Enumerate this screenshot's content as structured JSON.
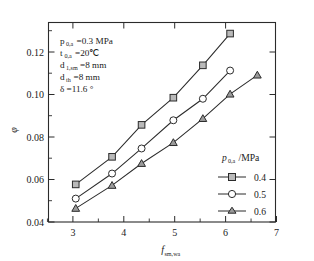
{
  "chart_data": {
    "type": "line",
    "title": "",
    "xlabel": "f_sm,wa",
    "ylabel": "φ",
    "xlim": [
      2.6,
      7.6
    ],
    "ylim": [
      0.04,
      0.1355
    ],
    "grid": false,
    "legend_position": "inside-bottom-right",
    "legend_title": "p0,a/MPa",
    "xticks": [
      "3",
      "4",
      "5",
      "6",
      "7"
    ],
    "xtick_values": [
      3,
      4,
      5,
      6,
      7
    ],
    "yticks": [
      "0.04",
      "0.06",
      "0.08",
      "0.10",
      "0.12"
    ],
    "ytick_values": [
      0.04,
      0.06,
      0.08,
      0.1,
      0.12
    ],
    "series": [
      {
        "name": "0.4",
        "marker": "square",
        "x": [
          3.2,
          4.0,
          4.65,
          5.35,
          6.0,
          6.6
        ],
        "values": [
          0.058,
          0.0712,
          0.0865,
          0.0995,
          0.115,
          0.1302
        ]
      },
      {
        "name": "0.5",
        "marker": "circle",
        "x": [
          3.2,
          4.0,
          4.65,
          5.35,
          6.0,
          6.6
        ],
        "values": [
          0.0512,
          0.0632,
          0.0752,
          0.0887,
          0.099,
          0.1125
        ]
      },
      {
        "name": "0.6",
        "marker": "triangle",
        "x": [
          3.2,
          4.0,
          4.65,
          5.35,
          6.0,
          6.6,
          7.2
        ],
        "values": [
          0.0465,
          0.0575,
          0.068,
          0.078,
          0.0895,
          0.1012,
          0.1103
        ]
      }
    ]
  },
  "annotations": {
    "lines": [
      {
        "sym": "p",
        "sub": "0,a",
        "rest": "=0.3 MPa"
      },
      {
        "sym": "t",
        "sub": "0,a",
        "rest": "=20℃"
      },
      {
        "sym": "d",
        "sub": "1,sm",
        "rest": "=8 mm"
      },
      {
        "sym": "d",
        "sub": "th",
        "rest": "=8 mm"
      },
      {
        "sym": "δ",
        "sub": "",
        "rest": "=11.6 °"
      }
    ]
  },
  "legend": {
    "title_sym": "p",
    "title_sub": "0,a",
    "title_rest": "/MPa",
    "items": [
      {
        "label": "0.4",
        "marker": "square"
      },
      {
        "label": "0.5",
        "marker": "circle"
      },
      {
        "label": "0.6",
        "marker": "triangle"
      }
    ]
  },
  "axis": {
    "ylabel_glyph": "φ",
    "xlabel_sym": "f",
    "xlabel_sub": "sm,wa"
  }
}
